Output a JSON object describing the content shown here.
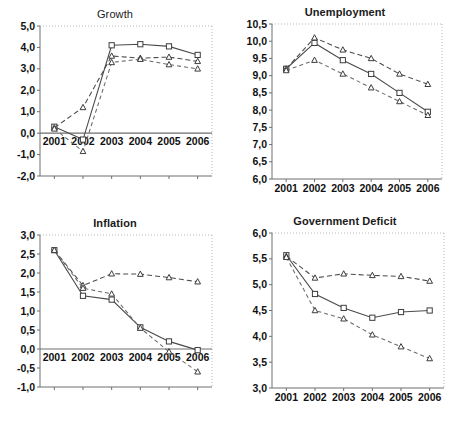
{
  "figure": {
    "panels_order": [
      "growth",
      "unemployment",
      "inflation",
      "government_deficit"
    ]
  },
  "chart_data": [
    {
      "id": "growth",
      "type": "line",
      "title": "Growth",
      "xlabel": "",
      "ylabel": "",
      "x": [
        "2001",
        "2002",
        "2003",
        "2004",
        "2005",
        "2006"
      ],
      "categories": [
        "2001",
        "2002",
        "2003",
        "2004",
        "2005",
        "2006"
      ],
      "ylim": [
        -2.0,
        5.0
      ],
      "yticks": [
        "5,0",
        "4,0",
        "3,0",
        "2,0",
        "1,0",
        "0,0",
        "-1,0",
        "-2,0"
      ],
      "ytick_values": [
        5.0,
        4.0,
        3.0,
        2.0,
        1.0,
        0.0,
        -1.0,
        -2.0
      ],
      "grid": false,
      "zero_line": true,
      "series": [
        {
          "name": "series-1",
          "style": "solid",
          "marker": "square",
          "values": [
            0.3,
            -0.3,
            4.1,
            4.15,
            4.05,
            3.65
          ]
        },
        {
          "name": "series-2",
          "style": "dashed",
          "marker": "triangle",
          "values": [
            0.25,
            1.2,
            3.6,
            3.5,
            3.55,
            3.35
          ]
        },
        {
          "name": "series-3",
          "style": "dashed-light",
          "marker": "triangle",
          "values": [
            0.2,
            -0.85,
            3.3,
            3.45,
            3.2,
            3.0
          ]
        }
      ]
    },
    {
      "id": "unemployment",
      "type": "line",
      "title": "Unemployment",
      "xlabel": "",
      "ylabel": "",
      "x": [
        "2001",
        "2002",
        "2003",
        "2004",
        "2005",
        "2006"
      ],
      "categories": [
        "2001",
        "2002",
        "2003",
        "2004",
        "2005",
        "2006"
      ],
      "ylim": [
        6.0,
        10.5
      ],
      "yticks": [
        "10,5",
        "10,0",
        "9,5",
        "9,0",
        "8,5",
        "8,0",
        "7,5",
        "7,0",
        "6,5",
        "6,0"
      ],
      "ytick_values": [
        10.5,
        10.0,
        9.5,
        9.0,
        8.5,
        8.0,
        7.5,
        7.0,
        6.5,
        6.0
      ],
      "grid": false,
      "zero_line": false,
      "series": [
        {
          "name": "series-1",
          "style": "solid",
          "marker": "square",
          "values": [
            9.2,
            9.95,
            9.45,
            9.05,
            8.5,
            7.95
          ]
        },
        {
          "name": "series-2",
          "style": "dashed",
          "marker": "triangle",
          "values": [
            9.2,
            10.1,
            9.75,
            9.5,
            9.05,
            8.75
          ]
        },
        {
          "name": "series-3",
          "style": "dashed-light",
          "marker": "triangle",
          "values": [
            9.15,
            9.45,
            9.05,
            8.65,
            8.25,
            7.85
          ]
        }
      ]
    },
    {
      "id": "inflation",
      "type": "line",
      "title": "Inflation",
      "xlabel": "",
      "ylabel": "",
      "x": [
        "2001",
        "2002",
        "2003",
        "2004",
        "2005",
        "2006"
      ],
      "categories": [
        "2001",
        "2002",
        "2003",
        "2004",
        "2005",
        "2006"
      ],
      "ylim": [
        -1.0,
        3.0
      ],
      "yticks": [
        "3,0",
        "2,5",
        "2,0",
        "1,5",
        "1,0",
        "0,5",
        "0,0",
        "-0,5",
        "-1,0"
      ],
      "ytick_values": [
        3.0,
        2.5,
        2.0,
        1.5,
        1.0,
        0.5,
        0.0,
        -0.5,
        -1.0
      ],
      "grid": false,
      "zero_line": true,
      "series": [
        {
          "name": "series-1",
          "style": "solid",
          "marker": "square",
          "values": [
            2.6,
            1.4,
            1.3,
            0.57,
            0.2,
            -0.03
          ]
        },
        {
          "name": "series-2",
          "style": "dashed",
          "marker": "triangle",
          "values": [
            2.6,
            1.67,
            1.98,
            1.97,
            1.88,
            1.77
          ]
        },
        {
          "name": "series-3",
          "style": "dashed-light",
          "marker": "triangle",
          "values": [
            2.6,
            1.6,
            1.45,
            0.55,
            -0.07,
            -0.6
          ]
        }
      ]
    },
    {
      "id": "government_deficit",
      "type": "line",
      "title": "Government Deficit",
      "xlabel": "",
      "ylabel": "",
      "x": [
        "2001",
        "2002",
        "2003",
        "2004",
        "2005",
        "2006"
      ],
      "categories": [
        "2001",
        "2002",
        "2003",
        "2004",
        "2005",
        "2006"
      ],
      "ylim": [
        3.0,
        6.0
      ],
      "yticks": [
        "6,0",
        "5,5",
        "5,0",
        "4,5",
        "4,0",
        "3,5",
        "3,0"
      ],
      "ytick_values": [
        6.0,
        5.5,
        5.0,
        4.5,
        4.0,
        3.5,
        3.0
      ],
      "grid": false,
      "zero_line": false,
      "series": [
        {
          "name": "series-1",
          "style": "solid",
          "marker": "square",
          "values": [
            5.57,
            4.82,
            4.55,
            4.36,
            4.47,
            4.5
          ]
        },
        {
          "name": "series-2",
          "style": "dashed",
          "marker": "triangle",
          "values": [
            5.55,
            5.13,
            5.21,
            5.18,
            5.16,
            5.07
          ]
        },
        {
          "name": "series-3",
          "style": "dashed-light",
          "marker": "triangle",
          "values": [
            5.53,
            4.5,
            4.34,
            4.03,
            3.8,
            3.57
          ]
        }
      ]
    }
  ]
}
